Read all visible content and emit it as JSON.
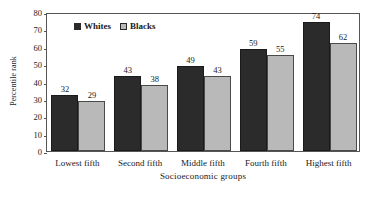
{
  "chart_data": {
    "type": "bar",
    "title": "",
    "subtitle": "",
    "xlabel": "Socioeconomic groups",
    "ylabel": "Percentile rank",
    "categories": [
      "Lowest fifth",
      "Second fifth",
      "Middle fifth",
      "Fourth fifth",
      "Highest fifth"
    ],
    "series": [
      {
        "name": "Whites",
        "color": "#2b2b2b",
        "values": [
          32,
          43,
          49,
          59,
          74
        ]
      },
      {
        "name": "Blacks",
        "color": "#b9b9b9",
        "values": [
          29,
          38,
          43,
          55,
          62
        ]
      }
    ],
    "ylim": [
      0,
      80
    ],
    "ytick_values": [
      0,
      10,
      20,
      30,
      40,
      50,
      60,
      70,
      80
    ],
    "ytick_labels": [
      "0",
      "10",
      "20",
      "30",
      "40",
      "50",
      "60",
      "70",
      "80"
    ],
    "grid": false,
    "legend_position": "top-left-inside",
    "data_labels": true,
    "frame": true,
    "bar_value_labels": {
      "Whites": [
        "32",
        "43",
        "49",
        "59",
        "74"
      ],
      "Blacks": [
        "29",
        "38",
        "43",
        "55",
        "62"
      ]
    }
  },
  "legend": {
    "entries": [
      {
        "label": "Whites",
        "swatch": "black-square-swatch"
      },
      {
        "label": "Blacks",
        "swatch": "light-gray-square-swatch"
      }
    ]
  },
  "axes": {
    "y_title": "Percentile rank",
    "x_title": "Socioeconomic groups"
  },
  "colors": {
    "whites_bar": "#2b2b2b",
    "blacks_bar": "#b9b9b9",
    "frame": "#555555",
    "text": "#1a1a1a",
    "background": "#ffffff"
  }
}
